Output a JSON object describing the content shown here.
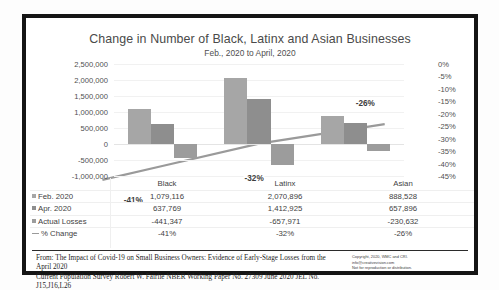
{
  "chart_data": {
    "type": "bar",
    "title": "Change in Number of Black, Latinx and Asian Businesses",
    "subtitle": "Feb., 2020 to April, 2020",
    "xlabel": "",
    "ylabel": "",
    "categories": [
      "Black",
      "Latinx",
      "Asian"
    ],
    "series": [
      {
        "name": "Feb. 2020",
        "values": [
          1079116,
          2070896,
          888528
        ],
        "type": "bar",
        "color": "#a6a6a6"
      },
      {
        "name": "Apr. 2020",
        "values": [
          637769,
          1412925,
          657896
        ],
        "type": "bar",
        "color": "#8e8e8e"
      },
      {
        "name": "Actual Losses",
        "values": [
          -441347,
          -657971,
          -230632
        ],
        "type": "bar",
        "color": "#9c9c9c"
      },
      {
        "name": "% Change",
        "values": [
          -41,
          -32,
          -26
        ],
        "type": "line",
        "axis": "secondary",
        "color": "#9a9a9a"
      }
    ],
    "ylim": [
      -1000000,
      2500000
    ],
    "y_ticks": [
      "2,500,000",
      "2,000,000",
      "1,500,000",
      "1,000,000",
      "500,000",
      "0",
      "-500,000",
      "-1,000,000"
    ],
    "y2lim": [
      -45,
      0
    ],
    "y2_ticks": [
      "0%",
      "-5%",
      "-10%",
      "-15%",
      "-20%",
      "-25%",
      "-30%",
      "-35%",
      "-40%",
      "-45%"
    ],
    "data_labels": [
      "-41%",
      "-32%",
      "-26%"
    ],
    "grid": true,
    "legend_position": "table-left"
  },
  "table": {
    "header": [
      "",
      "Black",
      "Latinx",
      "Asian"
    ],
    "rows": [
      {
        "label": "Feb. 2020",
        "marker": "square-light",
        "values": [
          "1,079,116",
          "2,070,896",
          "888,528"
        ]
      },
      {
        "label": "Apr. 2020",
        "marker": "square-dark",
        "values": [
          "637,769",
          "1,412,925",
          "657,896"
        ]
      },
      {
        "label": "Actual Losses",
        "marker": "square-mid",
        "values": [
          "-441,347",
          "-657,971",
          "-230,632"
        ]
      },
      {
        "label": "% Change",
        "marker": "line",
        "values": [
          "-41%",
          "-32%",
          "-26%"
        ]
      }
    ]
  },
  "footer": {
    "source_line1": "From: The Impact of Covid-19 on Small Business Owners: Evidence of Early-Stage Losses from the April 2020",
    "source_line2": "Current Population Survey Robert W. Fairlie NBER Working Paper No. 27309 June 2020 JEL No. J15,J16,L26",
    "copyright_line1": "Copyright, 2020, WMC and CRI.",
    "copyright_line2": "info@creativevision.com",
    "copyright_line3": "Not for reproduction or distribution."
  },
  "colors": {
    "series1": "#a6a6a6",
    "series2": "#8e8e8e",
    "series3": "#9c9c9c",
    "trendline": "#9a9a9a",
    "frame": "#151515"
  }
}
